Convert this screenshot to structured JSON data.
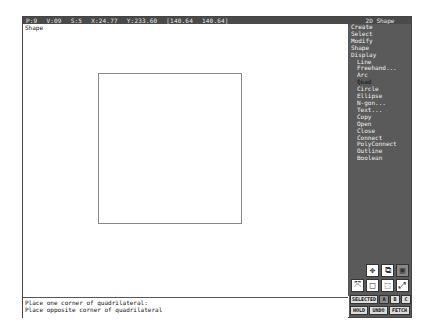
{
  "status_bar": {
    "fields": [
      "P:9",
      "V:09",
      "S:5",
      "X:24.77",
      "Y:233.60",
      "[140.64",
      "140.64]"
    ]
  },
  "app_title": "2D Shape",
  "canvas": {
    "label": "Shape",
    "shape": {
      "type": "quadrilateral",
      "color": "#888888"
    }
  },
  "prompt": {
    "line1": "Place one corner of quadrilateral:",
    "line2": "Place opposite corner of quadrilateral"
  },
  "menu": {
    "items": [
      {
        "label": "Create",
        "level": 0
      },
      {
        "label": "Select",
        "level": 0
      },
      {
        "label": "Modify",
        "level": 0
      },
      {
        "label": "Shape",
        "level": 0
      },
      {
        "label": "Display",
        "level": 0
      },
      {
        "label": "Line",
        "level": 1
      },
      {
        "label": "Freehand...",
        "level": 1
      },
      {
        "label": "Arc",
        "level": 1
      },
      {
        "label": "Quad",
        "level": 1,
        "active": true
      },
      {
        "label": "Circle",
        "level": 1
      },
      {
        "label": "Ellipse",
        "level": 1
      },
      {
        "label": "N-gon...",
        "level": 1
      },
      {
        "label": "Text...",
        "level": 1
      },
      {
        "label": "Copy",
        "level": 1
      },
      {
        "label": "Open",
        "level": 1
      },
      {
        "label": "Close",
        "level": 1
      },
      {
        "label": "Connect",
        "level": 1
      },
      {
        "label": "PolyConnect",
        "level": 1
      },
      {
        "label": "Outline",
        "level": 1
      },
      {
        "label": "Boolean",
        "level": 1
      }
    ]
  },
  "tools": {
    "row1": [
      {
        "name": "move-icon",
        "glyph": "✥"
      },
      {
        "name": "zoom-window-icon",
        "glyph": "⧉"
      },
      {
        "name": "grid-icon",
        "glyph": "▣"
      }
    ],
    "row2": [
      {
        "name": "shrink-icon",
        "glyph": "⤧"
      },
      {
        "name": "frame-icon",
        "glyph": "□"
      },
      {
        "name": "3d-box-icon",
        "glyph": "⬚"
      },
      {
        "name": "expand-icon",
        "glyph": "⤢"
      }
    ]
  },
  "buttons": {
    "row1": [
      "SELECTED",
      "A",
      "B",
      "C"
    ],
    "row2": [
      "HOLD",
      "UNDO",
      "FETCH"
    ]
  }
}
